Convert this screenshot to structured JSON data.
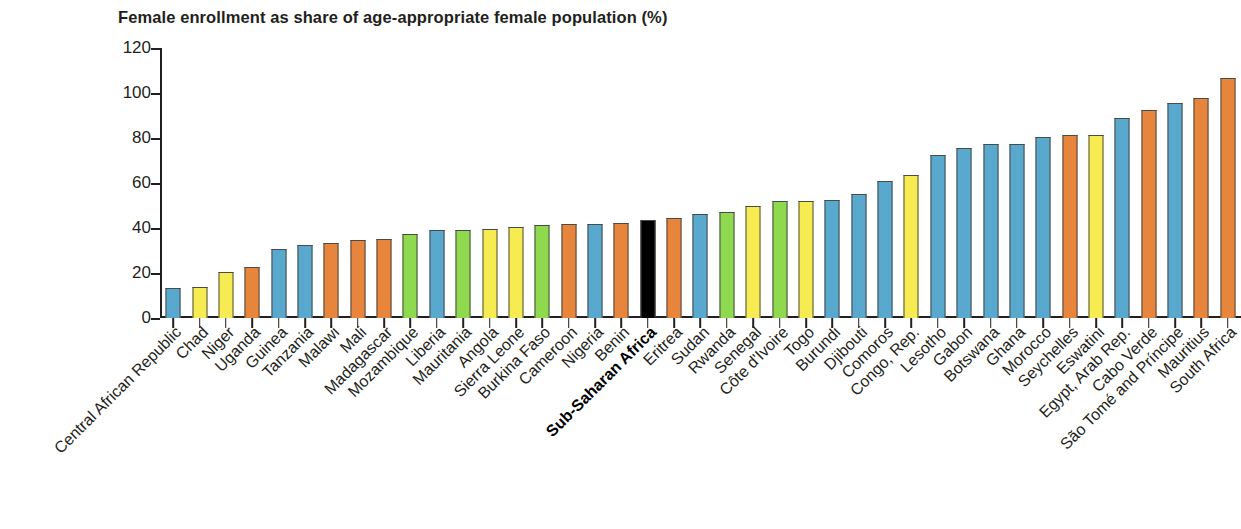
{
  "chart_data": {
    "type": "bar",
    "title": "Female enrollment as share of age-appropriate female population (%)",
    "xlabel": "",
    "ylabel": "",
    "ylim": [
      0,
      120
    ],
    "yticks": [
      0,
      20,
      40,
      60,
      80,
      100,
      120
    ],
    "grid": false,
    "legend": null,
    "highlight_category": "Sub-Saharan Africa",
    "palette": {
      "blue": "#58a9cd",
      "yellow": "#f6ec52",
      "orange": "#e8853c",
      "green": "#8ed94e",
      "black": "#000000",
      "axis": "#231f20",
      "bar_outline": "#4a4a4a"
    },
    "categories": [
      "Central African Republic",
      "Chad",
      "Niger",
      "Uganda",
      "Guinea",
      "Tanzania",
      "Malawi",
      "Mali",
      "Madagascar",
      "Mozambique",
      "Liberia",
      "Mauritania",
      "Angola",
      "Sierra Leone",
      "Burkina Faso",
      "Cameroon",
      "Nigeria",
      "Benin",
      "Sub-Saharan Africa",
      "Eritrea",
      "Sudan",
      "Rwanda",
      "Senegal",
      "Côte d'Ivoire",
      "Togo",
      "Burundi",
      "Djibouti",
      "Comoros",
      "Congo, Rep.",
      "Lesotho",
      "Gabon",
      "Botswana",
      "Ghana",
      "Morocco",
      "Seychelles",
      "Eswatini",
      "Egypt, Arab Rep.",
      "Cabo Verde",
      "São Tomé and Príncipe",
      "Mauritius",
      "South Africa"
    ],
    "values": [
      13.5,
      14.0,
      20.5,
      22.5,
      30.5,
      32.5,
      33.5,
      34.5,
      35.0,
      37.5,
      39.0,
      39.3,
      39.6,
      40.5,
      41.2,
      41.7,
      42.0,
      42.2,
      43.5,
      44.3,
      46.3,
      47.0,
      50.0,
      51.8,
      52.0,
      52.3,
      55.0,
      61.0,
      63.5,
      72.5,
      75.7,
      77.3,
      77.5,
      80.3,
      81.3,
      81.5,
      88.8,
      92.3,
      95.5,
      98.0,
      106.5
    ],
    "colors": [
      "blue",
      "yellow",
      "yellow",
      "orange",
      "blue",
      "blue",
      "orange",
      "orange",
      "orange",
      "green",
      "blue",
      "green",
      "yellow",
      "yellow",
      "green",
      "orange",
      "blue",
      "orange",
      "black",
      "orange",
      "blue",
      "green",
      "yellow",
      "green",
      "yellow",
      "blue",
      "blue",
      "blue",
      "yellow",
      "blue",
      "blue",
      "blue",
      "blue",
      "blue",
      "orange",
      "yellow",
      "blue",
      "orange",
      "blue",
      "orange",
      "orange"
    ]
  }
}
